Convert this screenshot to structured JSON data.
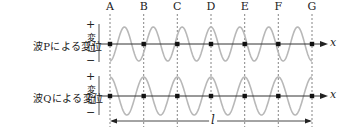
{
  "diagram": {
    "points": [
      "A",
      "B",
      "C",
      "D",
      "E",
      "F",
      "G"
    ],
    "point_x": [
      110,
      143.7,
      177.3,
      211,
      244.7,
      278.3,
      312
    ],
    "axis_label_x": "x",
    "length_label": "l",
    "rows": [
      {
        "id": "P",
        "label": "波Pによる変位",
        "axis_text": "変位",
        "plus": "+",
        "minus": "−",
        "axis_y": 44,
        "amplitude": 17,
        "wavelength_px": 28.857,
        "phase_at_A": "trough",
        "wave_color": "#b8b8b8"
      },
      {
        "id": "Q",
        "label": "波Qによる変位",
        "axis_text": "変位",
        "plus": "+",
        "minus": "−",
        "axis_y": 96,
        "amplitude": 19,
        "wavelength_px": 33.667,
        "phase_at_A": "crest",
        "wave_color": "#b8b8b8"
      }
    ],
    "colors": {
      "axis": "#333333",
      "dashed": "#666666",
      "dot": "#111111",
      "text": "#222222"
    }
  }
}
